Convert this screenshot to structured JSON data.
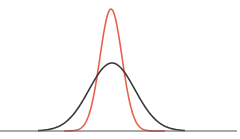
{
  "chart_data": {
    "type": "line",
    "title": "",
    "xlabel": "",
    "ylabel": "",
    "grid": false,
    "legend": "none",
    "series": [
      {
        "name": "narrow-distribution",
        "color": "#e8604c",
        "mean_px": 111,
        "sigma_px": 11,
        "peak_y_px": 9,
        "x_start_px": 64,
        "x_end_px": 165
      },
      {
        "name": "wide-distribution",
        "color": "#3a3a3a",
        "mean_px": 112,
        "sigma_px": 23,
        "peak_y_px": 63,
        "x_start_px": 38,
        "x_end_px": 185
      }
    ],
    "baseline": {
      "y_px": 131,
      "x_start_px": 0,
      "x_end_px": 237,
      "color": "#555555"
    }
  }
}
